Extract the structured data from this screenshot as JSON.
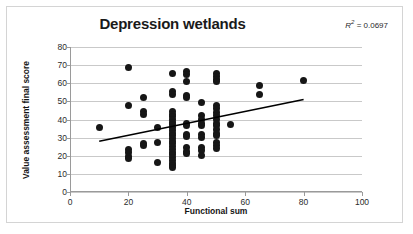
{
  "chart_data": {
    "type": "scatter",
    "title": "Depression wetlands",
    "xlabel": "Functional sum",
    "ylabel": "Value assessment final score",
    "xlim": [
      0,
      100
    ],
    "ylim": [
      0,
      80
    ],
    "xticks": [
      0,
      20,
      40,
      60,
      80,
      100
    ],
    "yticks": [
      0,
      10,
      20,
      30,
      40,
      50,
      60,
      70,
      80
    ],
    "grid": "horizontal",
    "legend": "none",
    "annotations": [
      {
        "name": "r-squared",
        "text": "R² = 0.0697",
        "r_label": "R",
        "r_superscript": "2",
        "r_equals": " = 0.0697",
        "value": 0.0697
      }
    ],
    "marker": {
      "shape": "circle",
      "color": "#161616",
      "size": 7
    },
    "trendline": {
      "type": "linear",
      "color": "#000000",
      "width": 1.6,
      "x_start": 10,
      "y_start": 28,
      "x_end": 80,
      "y_end": 51,
      "slope": 0.3286,
      "intercept": 24.71
    },
    "points": [
      {
        "x": 10,
        "y": 35.5
      },
      {
        "x": 20,
        "y": 68.5
      },
      {
        "x": 20,
        "y": 47.5
      },
      {
        "x": 20,
        "y": 23.5
      },
      {
        "x": 20,
        "y": 22.0
      },
      {
        "x": 20,
        "y": 19.5
      },
      {
        "x": 20,
        "y": 18.5
      },
      {
        "x": 25,
        "y": 52.0
      },
      {
        "x": 25,
        "y": 44.5
      },
      {
        "x": 25,
        "y": 42.5
      },
      {
        "x": 25,
        "y": 27.0
      },
      {
        "x": 25,
        "y": 25.5
      },
      {
        "x": 30,
        "y": 35.5
      },
      {
        "x": 30,
        "y": 27.5
      },
      {
        "x": 30,
        "y": 16.5
      },
      {
        "x": 35,
        "y": 65.5
      },
      {
        "x": 35,
        "y": 55.5
      },
      {
        "x": 35,
        "y": 54.0
      },
      {
        "x": 35,
        "y": 44.5
      },
      {
        "x": 35,
        "y": 43.0
      },
      {
        "x": 35,
        "y": 41.5
      },
      {
        "x": 35,
        "y": 40.0
      },
      {
        "x": 35,
        "y": 38.5
      },
      {
        "x": 35,
        "y": 37.0
      },
      {
        "x": 35,
        "y": 35.5
      },
      {
        "x": 35,
        "y": 34.0
      },
      {
        "x": 35,
        "y": 32.5
      },
      {
        "x": 35,
        "y": 31.0
      },
      {
        "x": 35,
        "y": 29.5
      },
      {
        "x": 35,
        "y": 28.0
      },
      {
        "x": 35,
        "y": 26.5
      },
      {
        "x": 35,
        "y": 25.0
      },
      {
        "x": 35,
        "y": 23.5
      },
      {
        "x": 35,
        "y": 22.0
      },
      {
        "x": 35,
        "y": 20.5
      },
      {
        "x": 35,
        "y": 19.0
      },
      {
        "x": 35,
        "y": 17.5
      },
      {
        "x": 35,
        "y": 16.0
      },
      {
        "x": 35,
        "y": 14.5
      },
      {
        "x": 35,
        "y": 13.5
      },
      {
        "x": 40,
        "y": 66.5
      },
      {
        "x": 40,
        "y": 65.0
      },
      {
        "x": 40,
        "y": 61.0
      },
      {
        "x": 40,
        "y": 53.0
      },
      {
        "x": 40,
        "y": 52.0
      },
      {
        "x": 40,
        "y": 38.0
      },
      {
        "x": 40,
        "y": 36.5
      },
      {
        "x": 40,
        "y": 32.0
      },
      {
        "x": 40,
        "y": 30.5
      },
      {
        "x": 40,
        "y": 24.5
      },
      {
        "x": 40,
        "y": 22.5
      },
      {
        "x": 40,
        "y": 21.0
      },
      {
        "x": 45,
        "y": 49.5
      },
      {
        "x": 45,
        "y": 42.0
      },
      {
        "x": 45,
        "y": 40.0
      },
      {
        "x": 45,
        "y": 38.0
      },
      {
        "x": 45,
        "y": 36.5
      },
      {
        "x": 45,
        "y": 31.5
      },
      {
        "x": 45,
        "y": 30.0
      },
      {
        "x": 45,
        "y": 24.5
      },
      {
        "x": 45,
        "y": 23.0
      },
      {
        "x": 45,
        "y": 20.0
      },
      {
        "x": 50,
        "y": 65.5
      },
      {
        "x": 50,
        "y": 63.5
      },
      {
        "x": 50,
        "y": 62.0
      },
      {
        "x": 50,
        "y": 61.0
      },
      {
        "x": 50,
        "y": 47.5
      },
      {
        "x": 50,
        "y": 46.0
      },
      {
        "x": 50,
        "y": 44.0
      },
      {
        "x": 50,
        "y": 42.0
      },
      {
        "x": 50,
        "y": 40.0
      },
      {
        "x": 50,
        "y": 38.0
      },
      {
        "x": 50,
        "y": 36.5
      },
      {
        "x": 50,
        "y": 34.5
      },
      {
        "x": 50,
        "y": 32.5
      },
      {
        "x": 50,
        "y": 31.0
      },
      {
        "x": 50,
        "y": 27.5
      },
      {
        "x": 50,
        "y": 25.5
      },
      {
        "x": 50,
        "y": 24.0
      },
      {
        "x": 55,
        "y": 37.0
      },
      {
        "x": 65,
        "y": 59.0
      },
      {
        "x": 65,
        "y": 54.0
      },
      {
        "x": 80,
        "y": 61.5
      }
    ]
  }
}
